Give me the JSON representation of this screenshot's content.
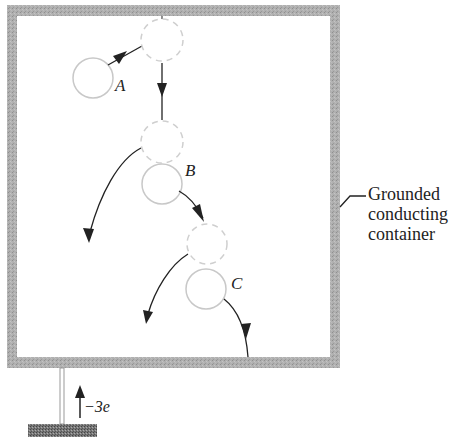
{
  "figure": {
    "container_label_lines": [
      "Grounded",
      "conducting",
      "container"
    ],
    "charge_label": "−3e",
    "balls": [
      {
        "id": "A",
        "label": "A"
      },
      {
        "id": "B",
        "label": "B"
      },
      {
        "id": "C",
        "label": "C"
      }
    ],
    "colors": {
      "wall": "#a9a9a9",
      "ball_stroke": "#c8c8c8",
      "dashed_stroke": "#c8c8c8",
      "arrow": "#222222",
      "ground": "#6e6e6e"
    }
  }
}
